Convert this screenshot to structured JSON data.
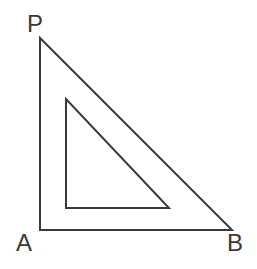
{
  "figure": {
    "background_color": "#ffffff",
    "stroke_color": "#3a3a3a",
    "stroke_width": 2,
    "canvas": {
      "width": 257,
      "height": 269
    },
    "labels": {
      "apex": "P",
      "bottom_left": "A",
      "bottom_right": "B"
    }
  },
  "chart_data": {
    "type": "diagram",
    "shapes": [
      {
        "name": "outer-triangle",
        "kind": "polygon",
        "closed": true,
        "points": [
          [
            40,
            38
          ],
          [
            40,
            230
          ],
          [
            232,
            230
          ]
        ],
        "vertex_labels": [
          "P",
          "A",
          "B"
        ],
        "stroke": "#3a3a3a",
        "stroke_width": 2,
        "fill": "none"
      },
      {
        "name": "inner-triangle",
        "kind": "polygon",
        "closed": true,
        "points": [
          [
            66,
            99
          ],
          [
            66,
            208
          ],
          [
            169,
            208
          ]
        ],
        "vertex_labels": [
          "",
          "",
          ""
        ],
        "stroke": "#3a3a3a",
        "stroke_width": 2,
        "fill": "none"
      }
    ],
    "annotations": [
      {
        "text": "P",
        "x": 34,
        "y": 24,
        "anchor": "middle"
      },
      {
        "text": "A",
        "x": 24,
        "y": 243,
        "anchor": "middle"
      },
      {
        "text": "B",
        "x": 235,
        "y": 243,
        "anchor": "middle"
      }
    ],
    "xlabel": "",
    "ylabel": "",
    "grid": false,
    "legend": false
  }
}
